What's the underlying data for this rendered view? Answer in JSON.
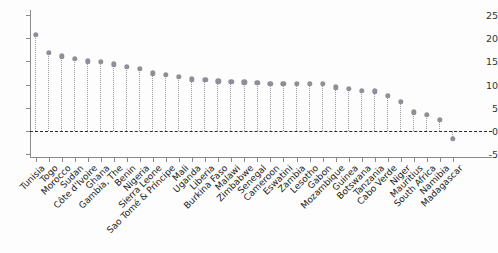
{
  "chart_data": {
    "type": "scatter",
    "title": "",
    "subtitle": "",
    "xlabel": "",
    "ylabel": "",
    "ylim": [
      -5,
      25
    ],
    "yticks": [
      -5,
      0,
      5,
      10,
      15,
      20,
      25
    ],
    "ytick_labels": [
      "-5",
      "0",
      "5",
      "10",
      "15",
      "20",
      "25"
    ],
    "grid": false,
    "legend": null,
    "zero_reference_line": 0,
    "marker_style": "circle-with-dotted-stem",
    "marker_color": "#8f8f97",
    "stem_color": "#9a9aa0",
    "axis_color": "#8a8a8a",
    "categories": [
      "Tunisia",
      "Togo",
      "Morocco",
      "Sudan",
      "Côte d'Ivoire",
      "Ghana",
      "Gambia, The",
      "Benin",
      "Nigeria",
      "Sierra Leone",
      "Sao Tomé & Príncipe",
      "Mali",
      "Uganda",
      "Liberia",
      "Burkina Faso",
      "Malawi",
      "Zimbabwe",
      "Senegal",
      "Cameroon",
      "Eswatini",
      "Zambia",
      "Lesotho",
      "Gabon",
      "Mozambique",
      "Guinea",
      "Botswana",
      "Tanzania",
      "Cabo Verde",
      "Niger",
      "Mauritius",
      "South Africa",
      "Namibia",
      "Madagascar"
    ],
    "values": [
      20.7,
      16.8,
      16.1,
      15.6,
      15.0,
      14.9,
      14.4,
      13.8,
      13.4,
      12.4,
      12.1,
      11.7,
      11.1,
      11.0,
      10.7,
      10.6,
      10.5,
      10.4,
      10.2,
      10.2,
      10.2,
      10.2,
      10.1,
      9.4,
      9.1,
      8.6,
      8.5,
      7.6,
      6.2,
      4.0,
      3.5,
      2.4,
      -1.7
    ]
  }
}
